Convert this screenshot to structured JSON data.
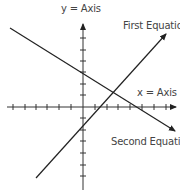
{
  "diagram": {
    "title": "",
    "labels": {
      "y_axis": "y = Axis",
      "x_axis": "x = Axis",
      "first_equation": "First Equation",
      "second_equation": "Second Equation"
    },
    "axes": {
      "origin_px": [
        83,
        107
      ],
      "x_ticks_px": [
        13,
        25,
        36,
        47,
        59,
        71,
        95,
        107,
        118,
        130,
        142,
        154,
        166
      ],
      "y_ticks_px": [
        38,
        50,
        61,
        72,
        84,
        95,
        118,
        130,
        141,
        153,
        165,
        176
      ]
    },
    "lines": [
      {
        "name": "first_equation",
        "from_px": [
          36,
          178
        ],
        "to_px": [
          166,
          34
        ],
        "arrow": "end"
      },
      {
        "name": "second_equation",
        "from_px": [
          10,
          28
        ],
        "to_px": [
          175,
          131
        ],
        "arrow": "end"
      }
    ],
    "colors": {
      "line": "#222222",
      "text": "#444444",
      "background": "#ffffff"
    }
  }
}
